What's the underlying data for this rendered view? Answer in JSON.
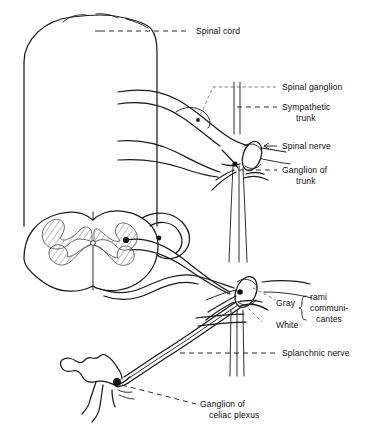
{
  "figure": {
    "background_color": "#fefefe",
    "ink_color": "#1a1a1a",
    "width": 365,
    "height": 436
  },
  "labels": {
    "spinal_cord": "Spinal cord",
    "spinal_ganglion": "Spinal ganglion",
    "sympathetic_trunk_line1": "Sympathetic",
    "sympathetic_trunk_line2": "trunk",
    "spinal_nerve": "Spinal nerve",
    "ganglion_of_trunk_line1": "Ganglion of",
    "ganglion_of_trunk_line2": "trunk",
    "gray": "Gray",
    "white": "White",
    "rami_line1": "rami",
    "rami_line2": "communi-",
    "rami_line3": "cantes",
    "splanchnic_nerve": "Splanchnic nerve",
    "ganglion_celiac_line1": "Ganglion of",
    "ganglion_celiac_line2": "celiac plexus"
  },
  "structures": {
    "spinal_cord_column": "spinal-cord-outline",
    "spinal_cord_cross_section": "spinal-cord-cross-section",
    "gray_matter": "butterfly-gray-matter-hatched",
    "sympathetic_trunk": "vertical-double-line-trunk",
    "upper_trunk_ganglion": "upper-sympathetic-ganglion",
    "lower_trunk_ganglion": "lower-sympathetic-ganglion",
    "celiac_ganglion": "star-shaped-celiac-ganglion",
    "splanchnic_nerve_path": "splanchnic-nerve-bundle"
  }
}
